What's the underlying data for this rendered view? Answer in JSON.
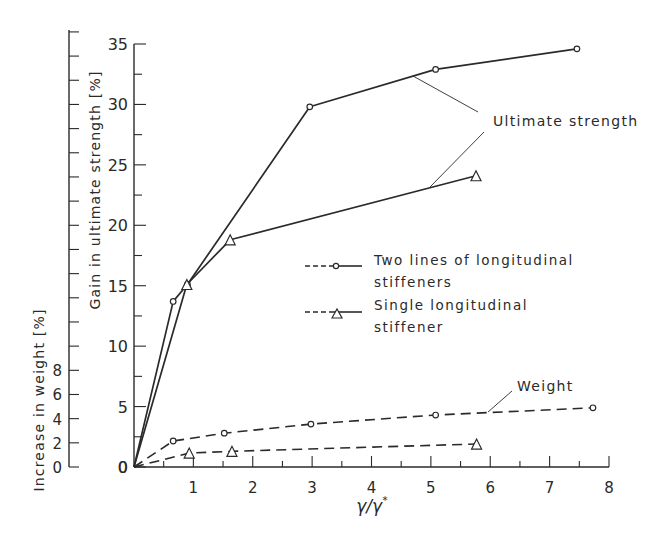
{
  "chart_data": {
    "type": "line",
    "title": "",
    "xlabel": "γ/γ*",
    "ylabel": "Gain in ultimate strength [%]",
    "ylabel_secondary": "Increase in weight [%]",
    "xlim": [
      0,
      8
    ],
    "ylim": [
      0,
      35
    ],
    "ylim_secondary": [
      0,
      8
    ],
    "x_ticks": [
      "1",
      "2",
      "3",
      "4",
      "5",
      "6",
      "7",
      "8"
    ],
    "y_ticks": [
      "0",
      "5",
      "10",
      "15",
      "20",
      "25",
      "30",
      "35"
    ],
    "y_ticks_secondary": [
      "0",
      "2",
      "4",
      "6",
      "8"
    ],
    "grid": false,
    "legend_position": "center-right",
    "legend": [
      {
        "label": "Two lines of longitudinal stiffeners",
        "marker": "circle"
      },
      {
        "label": "Single longitudinal stiffener",
        "marker": "triangle"
      }
    ],
    "annotations": [
      {
        "text": "Ultimate strength",
        "points_to": [
          "Two lines – ultimate strength",
          "Single – ultimate strength"
        ]
      },
      {
        "text": "Weight",
        "points_to": [
          "Two lines – weight"
        ]
      }
    ],
    "series": [
      {
        "name": "Two lines of longitudinal stiffeners – ultimate strength",
        "axis": "primary",
        "style": "solid",
        "marker": "circle",
        "x": [
          0,
          0.66,
          0.9,
          2.96,
          5.08,
          7.46
        ],
        "y": [
          0,
          13.7,
          15.1,
          29.8,
          32.9,
          34.6
        ]
      },
      {
        "name": "Single longitudinal stiffener – ultimate strength",
        "axis": "primary",
        "style": "solid",
        "marker": "triangle",
        "x": [
          0,
          0.89,
          1.62,
          5.76
        ],
        "y": [
          0,
          15.1,
          18.8,
          24.1
        ]
      },
      {
        "name": "Two lines of longitudinal stiffeners – weight",
        "axis": "primary-scale",
        "style": "dashed",
        "marker": "circle",
        "x": [
          0,
          0.66,
          1.52,
          2.98,
          5.08,
          7.73
        ],
        "y": [
          0,
          2.15,
          2.8,
          3.55,
          4.3,
          4.9
        ]
      },
      {
        "name": "Single longitudinal stiffener – weight",
        "axis": "primary-scale",
        "style": "dashed",
        "marker": "triangle",
        "x": [
          0,
          0.93,
          1.65,
          5.77
        ],
        "y": [
          0,
          1.15,
          1.3,
          1.9
        ]
      }
    ]
  },
  "layout": {
    "x0_px": 134,
    "x8_px": 609,
    "y0_px": 467,
    "y35_px": 44,
    "weight_axis_x_px": 69,
    "line_color": "#2a2a2a"
  },
  "labels": {
    "legend_two_line1": "Two lines of longitudinal",
    "legend_two_line2": "stiffeners",
    "legend_single_line1": "Single longitudinal",
    "legend_single_line2": "stiffener",
    "annotation_strength": "Ultimate strength",
    "annotation_weight": "Weight",
    "x_axis_label_main": "γ/γ",
    "x_axis_label_sup": "*"
  }
}
